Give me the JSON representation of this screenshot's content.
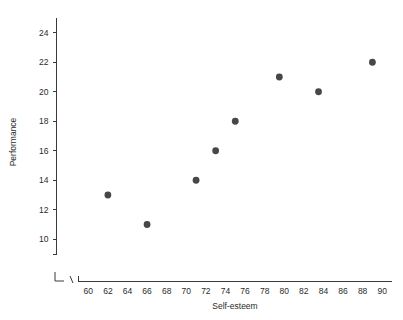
{
  "chart_data": {
    "type": "scatter",
    "title": "",
    "xlabel": "Self-esteem",
    "ylabel": "Performance",
    "xlim": [
      59,
      91
    ],
    "ylim": [
      9,
      25
    ],
    "grid": false,
    "legend": null,
    "x_ticks": [
      60,
      62,
      64,
      66,
      68,
      70,
      72,
      74,
      76,
      78,
      80,
      82,
      84,
      86,
      88,
      90
    ],
    "y_ticks": [
      10,
      12,
      14,
      16,
      18,
      20,
      22,
      24
    ],
    "axis_break": "x-axis has a break symbol between origin and first tick",
    "marker": {
      "shape": "circle",
      "color": "#474747",
      "size": 3.4
    },
    "points": [
      {
        "x": 62,
        "y": 13
      },
      {
        "x": 66,
        "y": 11
      },
      {
        "x": 71,
        "y": 14
      },
      {
        "x": 73,
        "y": 16
      },
      {
        "x": 75,
        "y": 18
      },
      {
        "x": 79.5,
        "y": 21
      },
      {
        "x": 83.5,
        "y": 20
      },
      {
        "x": 89,
        "y": 22
      }
    ]
  },
  "colors": {
    "axis": "#3a3a3a",
    "marker": "#474747",
    "text": "#2b2b2b",
    "background": "#ffffff"
  }
}
